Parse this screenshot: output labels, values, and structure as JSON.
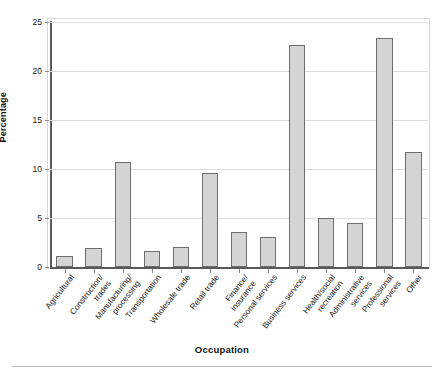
{
  "chart_data": {
    "type": "bar",
    "title": "",
    "xlabel": "Occupation",
    "ylabel": "Percentage",
    "ylim": [
      0,
      25
    ],
    "yticks": [
      0,
      5,
      10,
      15,
      20,
      25
    ],
    "grid": true,
    "legend": "none",
    "categories": [
      "Agricultural",
      "Construction/\ntrades",
      "Manufacturing/\nprocessing",
      "Transportation",
      "Wholesale trade",
      "Retail trade",
      "Finance/\ninsurance",
      "Personal services",
      "Business services",
      "Health/social\nrecreation",
      "Administrative\nservices",
      "Professional\nservices",
      "Other"
    ],
    "values": [
      1.1,
      1.9,
      10.7,
      1.6,
      2.0,
      9.6,
      3.6,
      3.1,
      22.7,
      5.0,
      4.5,
      23.4,
      11.7
    ],
    "bar_fill": "#d4d4d4",
    "bar_edge": "#6e6e6e",
    "gridline_color": "#dedede",
    "axis_color": "#5a5a5a"
  }
}
